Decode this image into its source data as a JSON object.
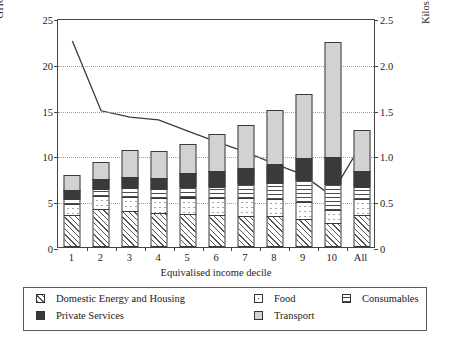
{
  "chart_data": {
    "type": "bar",
    "subtype": "stacked-bar-with-line-overlay",
    "title": "",
    "xlabel": "Equivalised income decile",
    "ylabel": "GHG emissions per capita (tonnes)",
    "y2label_line1": "Kilos of GHG emission per £ of Gross Household",
    "y2label_line2": "Annual Income",
    "categories": [
      "1",
      "2",
      "3",
      "4",
      "5",
      "6",
      "7",
      "8",
      "9",
      "10",
      "All"
    ],
    "ylim": [
      0,
      25
    ],
    "yticks": [
      0,
      5,
      10,
      15,
      20,
      25
    ],
    "y2lim": [
      0,
      2.5
    ],
    "y2ticks": [
      "0",
      "0.5",
      "1.0",
      "1.5",
      "2.0",
      "2.5"
    ],
    "grid": true,
    "legend_position": "bottom",
    "series": [
      {
        "name": "Domestic Energy and Housing",
        "pattern": "diagonal-hatch",
        "values": [
          3.5,
          4.1,
          3.9,
          3.7,
          3.6,
          3.5,
          3.4,
          3.4,
          3.1,
          2.6,
          3.5
        ]
      },
      {
        "name": "Food",
        "pattern": "dotted",
        "values": [
          1.3,
          1.6,
          1.7,
          1.7,
          1.9,
          1.9,
          2.0,
          1.9,
          1.9,
          1.5,
          1.8
        ]
      },
      {
        "name": "Consumables",
        "pattern": "horizontal-lines",
        "values": [
          0.6,
          0.8,
          1.0,
          1.1,
          1.3,
          1.4,
          1.7,
          1.9,
          2.5,
          3.0,
          1.5
        ]
      },
      {
        "name": "Private Services",
        "pattern": "solid-dark",
        "values": [
          1.1,
          1.2,
          1.3,
          1.3,
          1.6,
          1.8,
          1.8,
          2.1,
          2.5,
          3.0,
          1.8
        ]
      },
      {
        "name": "Transport",
        "pattern": "light-grey",
        "values": [
          1.8,
          2.0,
          3.1,
          3.1,
          3.2,
          4.1,
          4.8,
          6.0,
          7.1,
          12.7,
          4.6
        ]
      }
    ],
    "totals": [
      8.3,
      9.7,
      11.0,
      10.9,
      11.6,
      12.7,
      13.7,
      15.3,
      17.1,
      22.8,
      13.2
    ],
    "line": {
      "name": "Kilos of GHG emission per £ of Gross Household Annual Income",
      "axis": "right",
      "values": [
        2.27,
        1.5,
        1.43,
        1.4,
        1.28,
        1.16,
        1.05,
        0.92,
        0.8,
        0.57,
        1.1
      ]
    }
  },
  "legend": {
    "items": [
      {
        "label": "Domestic Energy and Housing",
        "pattern": "diagonal-hatch"
      },
      {
        "label": "Food",
        "pattern": "dotted"
      },
      {
        "label": "Consumables",
        "pattern": "horizontal-lines"
      },
      {
        "label": "Private Services",
        "pattern": "solid-dark"
      },
      {
        "label": "Transport",
        "pattern": "light-grey"
      }
    ]
  },
  "colors": {
    "axis": "#444444",
    "grid": "#9a9aa8",
    "line": "#3b3b3b",
    "transport": "#d2d2d2",
    "private_services": "#3a3a3a"
  }
}
